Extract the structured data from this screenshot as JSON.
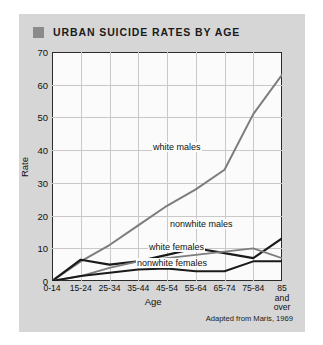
{
  "title": {
    "text": "URBAN SUICIDE RATES BY AGE",
    "bullet_color": "#8a8a8a"
  },
  "credit": "Adapted from Maris, 1969",
  "labels": {
    "white_males": "white males",
    "nonwhite_males": "nonwhite males",
    "white_females": "white females",
    "nonwhite_females": "nonwhite females"
  },
  "yticks": [
    "0",
    "10",
    "20",
    "30",
    "40",
    "50",
    "60",
    "70"
  ],
  "xticks": [
    "0-14",
    "15-24",
    "25-34",
    "35-44",
    "45-54",
    "55-64",
    "65-74",
    "75-84",
    "85\nand\nover"
  ],
  "chart_data": {
    "type": "line",
    "title": "URBAN SUICIDE RATES BY AGE",
    "xlabel": "Age",
    "ylabel": "Rate",
    "categories": [
      "0-14",
      "15-24",
      "25-34",
      "35-44",
      "45-54",
      "55-64",
      "65-74",
      "75-84",
      "85 and over"
    ],
    "ylim": [
      0,
      70
    ],
    "yticks": [
      0,
      10,
      20,
      30,
      40,
      50,
      60,
      70
    ],
    "grid": true,
    "legend": "inline-annotations",
    "series": [
      {
        "name": "white males",
        "color": "#7d7d7d",
        "width": 2.0,
        "values": [
          0,
          6,
          11,
          17,
          23,
          28,
          34,
          51,
          63
        ]
      },
      {
        "name": "nonwhite males",
        "color": "#1a1a1a",
        "width": 2.2,
        "values": [
          0,
          6.5,
          5,
          6,
          8,
          10,
          8.5,
          7,
          13
        ]
      },
      {
        "name": "white females",
        "color": "#7d7d7d",
        "width": 1.8,
        "values": [
          0,
          1.5,
          4,
          6,
          7,
          8,
          9,
          10,
          7
        ]
      },
      {
        "name": "nonwhite females",
        "color": "#1a1a1a",
        "width": 2.0,
        "values": [
          0,
          1.5,
          2.5,
          3.5,
          3.8,
          3,
          3,
          6,
          6
        ]
      }
    ]
  }
}
